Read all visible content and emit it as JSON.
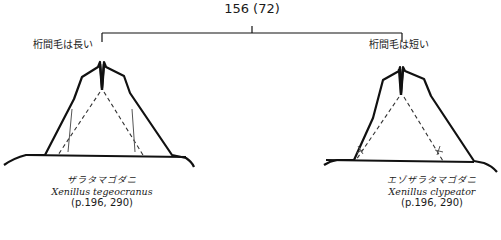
{
  "couplet": {
    "number": "⑮",
    "reference": "(⑫)",
    "label": "⑮⑥ (⑦②)",
    "display": "156 (72)"
  },
  "branches": [
    {
      "lead_text": "桁間毛は長い",
      "japanese_name": "ザラタマゴダニ",
      "scientific_name": "Xenillus tegeocranus",
      "page_ref": "(p.196, 290)",
      "seta_length": "long"
    },
    {
      "lead_text": "桁間毛は短い",
      "japanese_name": "エゾザラタマゴダニ",
      "scientific_name": "Xenillus clypeator",
      "page_ref": "(p.196, 290)",
      "seta_length": "short"
    }
  ],
  "colors": {
    "line": "#111111",
    "text": "#1a1a1a",
    "seta": "#555555"
  }
}
